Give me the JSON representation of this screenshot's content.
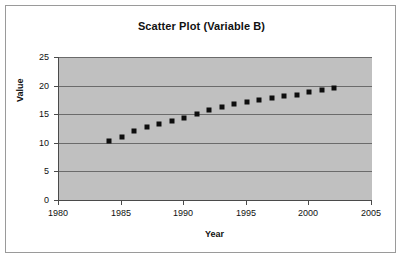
{
  "chart_data": {
    "type": "scatter",
    "title": "Scatter Plot (Variable B)",
    "xlabel": "Year",
    "ylabel": "Value",
    "xlim": [
      1980,
      2005
    ],
    "ylim": [
      0,
      25
    ],
    "xticks": [
      1980,
      1985,
      1990,
      1995,
      2000,
      2005
    ],
    "yticks": [
      0,
      5,
      10,
      15,
      20,
      25
    ],
    "grid": true,
    "legend": null,
    "marker": "square",
    "marker_color": "#0d0d0d",
    "plot_background": "#c0c0c0",
    "x": [
      1984,
      1985,
      1986,
      1987,
      1988,
      1989,
      1990,
      1991,
      1992,
      1993,
      1994,
      1995,
      1996,
      1997,
      1998,
      1999,
      2000,
      2001,
      2002
    ],
    "y": [
      10.3,
      11.1,
      12.0,
      12.7,
      13.3,
      13.8,
      14.4,
      15.1,
      15.7,
      16.2,
      16.7,
      17.1,
      17.5,
      17.8,
      18.1,
      18.4,
      18.8,
      19.2,
      19.6
    ],
    "points": [
      {
        "year": 1984,
        "value": 10.3
      },
      {
        "year": 1985,
        "value": 11.1
      },
      {
        "year": 1986,
        "value": 12.0
      },
      {
        "year": 1987,
        "value": 12.7
      },
      {
        "year": 1988,
        "value": 13.3
      },
      {
        "year": 1989,
        "value": 13.8
      },
      {
        "year": 1990,
        "value": 14.4
      },
      {
        "year": 1991,
        "value": 15.1
      },
      {
        "year": 1992,
        "value": 15.7
      },
      {
        "year": 1993,
        "value": 16.2
      },
      {
        "year": 1994,
        "value": 16.7
      },
      {
        "year": 1995,
        "value": 17.1
      },
      {
        "year": 1996,
        "value": 17.5
      },
      {
        "year": 1997,
        "value": 17.8
      },
      {
        "year": 1998,
        "value": 18.1
      },
      {
        "year": 1999,
        "value": 18.4
      },
      {
        "year": 2000,
        "value": 18.8
      },
      {
        "year": 2001,
        "value": 19.2
      },
      {
        "year": 2002,
        "value": 19.6
      }
    ]
  }
}
